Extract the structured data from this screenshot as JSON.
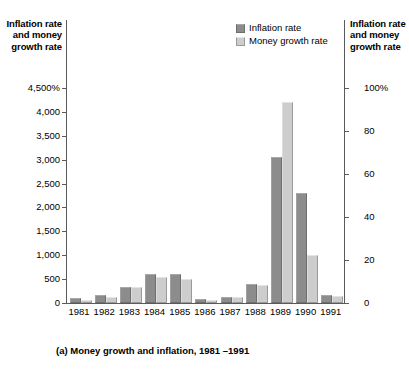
{
  "figure": {
    "caption": "(a) Money growth and inflation, 1981 –1991",
    "left_axis_title": "Inflation rate and money growth rate",
    "right_axis_title": "Inflation rate and money growth rate"
  },
  "legend": {
    "position": "top-right",
    "items": [
      {
        "label": "Inflation rate",
        "color": "#8c8c8c",
        "key": "inflation"
      },
      {
        "label": "Money growth rate",
        "color": "#cdcdcd",
        "key": "money"
      }
    ]
  },
  "left_ticks": [
    "4,500%",
    "4,000",
    "3,500",
    "3,000",
    "2,500",
    "2,000",
    "1,500",
    "1,000",
    "500",
    "0"
  ],
  "right_ticks": [
    "100%",
    "80",
    "60",
    "40",
    "20",
    "0"
  ],
  "chart_data": {
    "type": "bar",
    "title": "(a) Money growth and inflation, 1981 –1991",
    "xlabel": "",
    "ylabel": "Inflation rate and money growth rate",
    "ylim": [
      0,
      4500
    ],
    "ytick_values": [
      0,
      500,
      1000,
      1500,
      2000,
      2500,
      3000,
      3500,
      4000,
      4500
    ],
    "ytick_labels": [
      "0",
      "500",
      "1,000",
      "1,500",
      "2,000",
      "2,500",
      "3,000",
      "3,500",
      "4,000",
      "4,500%"
    ],
    "y2lim": [
      0,
      100
    ],
    "y2tick_values": [
      0,
      20,
      40,
      60,
      80,
      100
    ],
    "y2tick_labels": [
      "0",
      "20",
      "40",
      "60",
      "80",
      "100%"
    ],
    "grid": false,
    "legend_position": "upper right",
    "categories": [
      "1981",
      "1982",
      "1983",
      "1984",
      "1985",
      "1986",
      "1987",
      "1988",
      "1989",
      "1990",
      "1991"
    ],
    "series": [
      {
        "name": "Inflation rate",
        "color": "#8c8c8c",
        "values": [
          105,
          165,
          330,
          600,
          600,
          90,
          135,
          390,
          3050,
          2300,
          175
        ]
      },
      {
        "name": "Money growth rate",
        "color": "#cdcdcd",
        "values": [
          60,
          130,
          340,
          540,
          500,
          70,
          120,
          370,
          4200,
          1000,
          150
        ]
      }
    ]
  }
}
